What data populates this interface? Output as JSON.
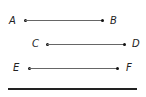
{
  "diagram": {
    "segments": [
      {
        "start_label": "A",
        "end_label": "B"
      },
      {
        "start_label": "C",
        "end_label": "D"
      },
      {
        "start_label": "E",
        "end_label": "F"
      }
    ],
    "colors": {
      "line": "#666666",
      "point": "#111111",
      "baseline": "#222222"
    }
  }
}
